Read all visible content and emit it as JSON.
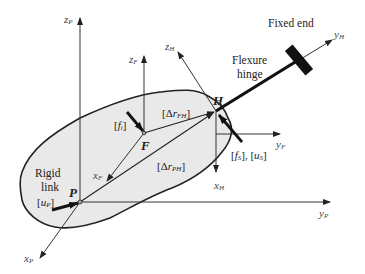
{
  "diagram": {
    "type": "mechanism-schematic",
    "colors": {
      "blob_fill": "#e9e9e9",
      "line": "#222222",
      "hinge": "#111111"
    },
    "points": {
      "P": {
        "label": "P",
        "x": 80,
        "y": 202
      },
      "F": {
        "label": "F",
        "x": 144,
        "y": 133
      },
      "H": {
        "label": "H",
        "x": 216,
        "y": 111
      }
    },
    "axes": {
      "zP": {
        "main": "z",
        "sub": "P"
      },
      "yP": {
        "main": "y",
        "sub": "P"
      },
      "xP": {
        "main": "x",
        "sub": "P"
      },
      "zF": {
        "main": "z",
        "sub": "F"
      },
      "yF": {
        "main": "y",
        "sub": "F"
      },
      "xF": {
        "main": "x",
        "sub": "F"
      },
      "zH": {
        "main": "z",
        "sub": "H"
      },
      "yH": {
        "main": "y",
        "sub": "H"
      },
      "xH": {
        "main": "x",
        "sub": "H"
      }
    },
    "labels": {
      "fixed_end": "Fixed end",
      "flexure_line1": "Flexure",
      "flexure_line2": "hinge",
      "rigid_line1": "Rigid",
      "rigid_line2": "link"
    },
    "vectors": {
      "fi": {
        "open": "[",
        "main": "f",
        "sub": "i",
        "close": "]"
      },
      "uP": {
        "open": "[",
        "main": "u",
        "sub": "P",
        "close": "]"
      },
      "drFH": {
        "open": "[Δ",
        "main": "r",
        "sub": "FH",
        "close": "]"
      },
      "drPH": {
        "open": "[Δ",
        "main": "r",
        "sub": "PH",
        "close": "]"
      },
      "fs_us": {
        "text1": "[",
        "main1": "f",
        "sub1": "S",
        "mid": "], [",
        "main2": "u",
        "sub2": "S",
        "close": "]"
      }
    }
  }
}
